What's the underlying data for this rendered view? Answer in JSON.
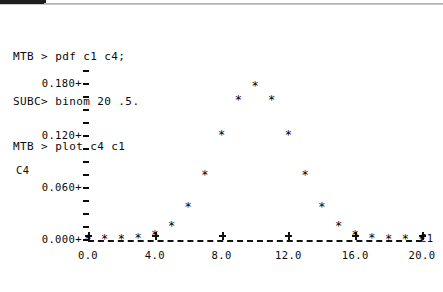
{
  "session": {
    "lines": [
      "MTB > pdf c1 c4;",
      "SUBC> binom 20 .5.",
      "MTB > plot c4 c1"
    ]
  },
  "plot": {
    "y_axis_label": "C4",
    "x_axis_label": "C1",
    "y_tick_labels": [
      "0.180+",
      "0.120+",
      "0.060+",
      "0.000+"
    ],
    "x_tick_labels": [
      "0.0",
      "4.0",
      "8.0",
      "12.0",
      "16.0",
      "20.0"
    ],
    "point_glyph": "*"
  },
  "chart_data": {
    "type": "scatter",
    "title": "",
    "xlabel": "C1",
    "ylabel": "C4",
    "xlim": [
      0,
      20
    ],
    "ylim": [
      0.0,
      0.19
    ],
    "grid": false,
    "legend": null,
    "x_ticks": [
      0,
      4,
      8,
      12,
      16,
      20
    ],
    "x_tick_labels": [
      "0.0",
      "4.0",
      "8.0",
      "12.0",
      "16.0",
      "20.0"
    ],
    "y_ticks": [
      0.0,
      0.06,
      0.12,
      0.18
    ],
    "y_tick_labels": [
      "0.000+",
      "0.060+",
      "0.120+",
      "0.180+"
    ],
    "y_minor_ticks_per_interval": 3,
    "distribution": "binomial(n=20, p=0.5) probability density",
    "x": [
      0,
      1,
      2,
      3,
      4,
      5,
      6,
      7,
      8,
      9,
      10,
      11,
      12,
      13,
      14,
      15,
      16,
      17,
      18,
      19,
      20
    ],
    "y": [
      1e-06,
      1.9e-05,
      0.000181,
      0.001087,
      0.004621,
      0.014786,
      0.036964,
      0.073929,
      0.120134,
      0.160179,
      0.176197,
      0.160179,
      0.120134,
      0.073929,
      0.036964,
      0.014786,
      0.004621,
      0.001087,
      0.000181,
      1.9e-05,
      1e-06
    ]
  }
}
